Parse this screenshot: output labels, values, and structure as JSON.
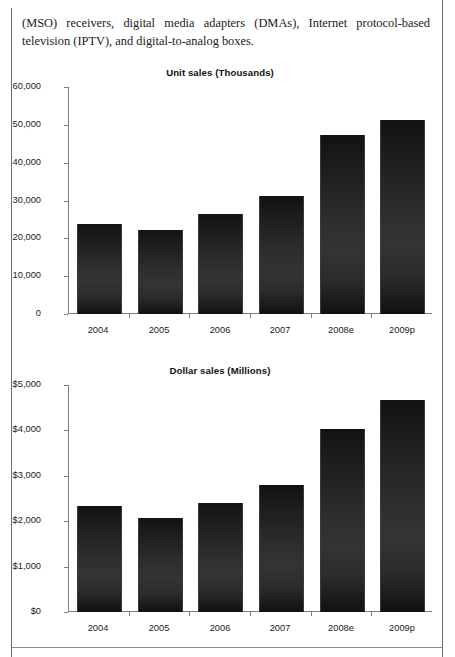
{
  "document": {
    "body_text": "(MSO) receivers, digital media adapters (DMAs), Internet protocol-based television (IPTV), and digital-to-analog boxes."
  },
  "chart_data": [
    {
      "type": "bar",
      "title": "Unit sales (Thousands)",
      "xlabel": "",
      "ylabel": "",
      "categories": [
        "2004",
        "2005",
        "2006",
        "2007",
        "2008e",
        "2009p"
      ],
      "values": [
        23800,
        22200,
        26400,
        31200,
        47300,
        51300
      ],
      "ylim": [
        0,
        60000
      ],
      "yticks": [
        0,
        10000,
        20000,
        30000,
        40000,
        50000,
        60000
      ],
      "ytick_labels": [
        "0",
        "10,000",
        "20,000",
        "30,000",
        "40,000",
        "50,000",
        "60,000"
      ],
      "grid": false,
      "legend": "none",
      "bar_color": "#262626"
    },
    {
      "type": "bar",
      "title": "Dollar sales (Millions)",
      "xlabel": "",
      "ylabel": "",
      "categories": [
        "2004",
        "2005",
        "2006",
        "2007",
        "2008e",
        "2009p"
      ],
      "values": [
        2330,
        2070,
        2400,
        2800,
        4020,
        4670
      ],
      "ylim": [
        0,
        5000
      ],
      "yticks": [
        0,
        1000,
        2000,
        3000,
        4000,
        5000
      ],
      "ytick_labels": [
        "$0",
        "$1,000",
        "$2,000",
        "$3,000",
        "$4,000",
        "$5,000"
      ],
      "grid": false,
      "legend": "none",
      "bar_color": "#262626"
    }
  ]
}
